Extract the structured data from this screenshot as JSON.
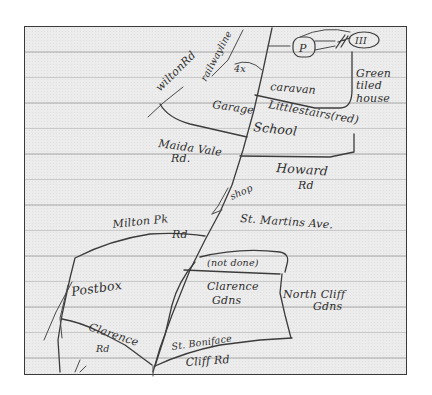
{
  "map": {
    "type": "hand-drawn sketch map on lined notebook paper",
    "labels": {
      "wilton_rd": "wiltonRd",
      "railway_line": "railwayline",
      "four_x": "4x",
      "parking": "P",
      "three_marks": "III",
      "caravan": "caravan",
      "green_tiled_house_1": "Green",
      "green_tiled_house_2": "tiled",
      "green_tiled_house_3": "house",
      "garage": "Garage",
      "little_stairs": "Littlestairs(red)",
      "school": "School",
      "maida_vale_1": "Maida Vale",
      "maida_vale_2": "Rd.",
      "howard_rd_1": "Howard",
      "howard_rd_2": "Rd",
      "shop": "shop",
      "st_martins_ave": "St. Martins Ave.",
      "milton_pk_1": "Milton Pk",
      "milton_pk_2": "Rd",
      "not_done": "(not done)",
      "clarence_gdns_1": "Clarence",
      "clarence_gdns_2": "Gdns",
      "north_cliff_1": "North Cliff",
      "north_cliff_2": "Gdns",
      "postbox": "Postbox",
      "clarence_rd_1": "Clarence",
      "clarence_rd_2": "Rd",
      "st_boniface": "St. Boniface",
      "cliff_rd": "Cliff Rd"
    },
    "colors": {
      "ink": "#2e2e2e",
      "paper": "#ececec",
      "ruled_line": "#c9c9c9",
      "frame": "#3a3a3a"
    }
  }
}
